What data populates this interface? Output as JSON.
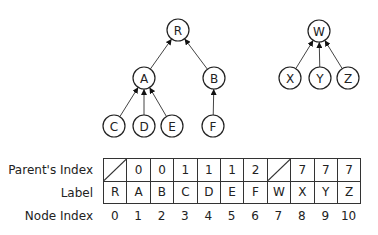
{
  "trees": {
    "nodes": [
      {
        "id": "R",
        "label": "R",
        "x": 178,
        "y": 30
      },
      {
        "id": "A",
        "label": "A",
        "x": 144,
        "y": 78
      },
      {
        "id": "B",
        "label": "B",
        "x": 214,
        "y": 78
      },
      {
        "id": "C",
        "label": "C",
        "x": 114,
        "y": 126
      },
      {
        "id": "D",
        "label": "D",
        "x": 144,
        "y": 126
      },
      {
        "id": "E",
        "label": "E",
        "x": 172,
        "y": 126
      },
      {
        "id": "F",
        "label": "F",
        "x": 213,
        "y": 126
      },
      {
        "id": "W",
        "label": "W",
        "x": 319,
        "y": 31
      },
      {
        "id": "X",
        "label": "X",
        "x": 290,
        "y": 78
      },
      {
        "id": "Y",
        "label": "Y",
        "x": 320,
        "y": 78
      },
      {
        "id": "Z",
        "label": "Z",
        "x": 348,
        "y": 78
      }
    ],
    "edges": [
      {
        "from": "A",
        "to": "R"
      },
      {
        "from": "B",
        "to": "R"
      },
      {
        "from": "C",
        "to": "A"
      },
      {
        "from": "D",
        "to": "A"
      },
      {
        "from": "E",
        "to": "A"
      },
      {
        "from": "F",
        "to": "B"
      },
      {
        "from": "X",
        "to": "W"
      },
      {
        "from": "Y",
        "to": "W"
      },
      {
        "from": "Z",
        "to": "W"
      }
    ]
  },
  "table": {
    "row_labels": {
      "parent": "Parent's Index",
      "label": "Label",
      "index": "Node Index"
    },
    "parent_index": [
      "",
      "0",
      "0",
      "1",
      "1",
      "1",
      "2",
      "",
      "7",
      "7",
      "7"
    ],
    "labels": [
      "R",
      "A",
      "B",
      "C",
      "D",
      "E",
      "F",
      "W",
      "X",
      "Y",
      "Z"
    ],
    "node_index": [
      "0",
      "1",
      "2",
      "3",
      "4",
      "5",
      "6",
      "7",
      "8",
      "9",
      "10"
    ],
    "null_cells": [
      0,
      7
    ]
  }
}
